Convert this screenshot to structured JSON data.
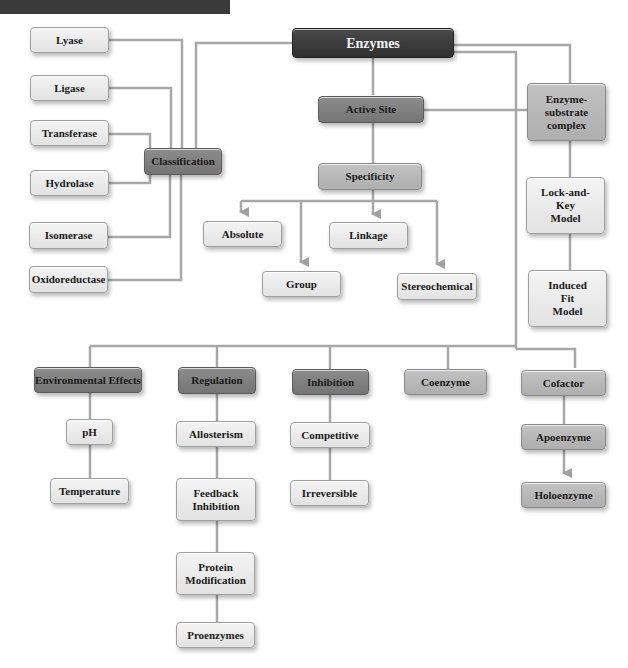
{
  "colors": {
    "root": "#3a3a3a",
    "dark": "#828282",
    "mid": "#b8b8b8",
    "light": "#ececec",
    "connector": "#a8a8a8"
  },
  "root": {
    "label": "Enzymes"
  },
  "classification": {
    "label": "Classification",
    "children": [
      "Lyase",
      "Ligase",
      "Transferase",
      "Hydrolase",
      "Isomerase",
      "Oxidoreductase"
    ]
  },
  "active_site": {
    "label": "Active Site"
  },
  "specificity": {
    "label": "Specificity",
    "children": [
      "Absolute",
      "Group",
      "Linkage",
      "Stereochemical"
    ]
  },
  "es_complex": {
    "label": "Enzyme-\nsubstrate\ncomplex",
    "children": [
      "Lock-and-\nKey\nModel",
      "Induced\nFit\nModel"
    ]
  },
  "bottom": {
    "environmental": {
      "label": "Environmental Effects",
      "children": [
        "pH",
        "Temperature"
      ]
    },
    "regulation": {
      "label": "Regulation",
      "children": [
        "Allosterism",
        "Feedback\nInhibition",
        "Protein\nModification",
        "Proenzymes"
      ]
    },
    "inhibition": {
      "label": "Inhibition",
      "children": [
        "Competitive",
        "Irreversible"
      ]
    },
    "coenzyme": {
      "label": "Coenzyme"
    },
    "cofactor": {
      "label": "Cofactor",
      "children": [
        "Apoenzyme",
        "Holoenzyme"
      ]
    }
  }
}
